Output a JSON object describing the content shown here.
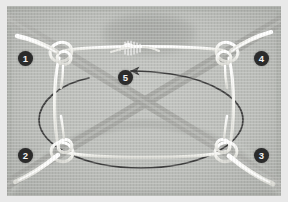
{
  "figure": {
    "width": 288,
    "height": 202,
    "frame_color": "#e9e9e9",
    "plate_color": "#b9bbb8",
    "cord_color": "#f4f4f0",
    "strap_color": "#a9aaa6",
    "arrow_color": "#3a3a3a",
    "marker_fill": "#2b2b2b",
    "marker_text_color": "#f2f2f2"
  },
  "markers": [
    {
      "id": "step-1",
      "label": "1",
      "x": 18,
      "y": 51,
      "note": "upper-left corner knot"
    },
    {
      "id": "step-2",
      "label": "2",
      "x": 18,
      "y": 148,
      "note": "lower-left corner knot"
    },
    {
      "id": "step-3",
      "label": "3",
      "x": 254,
      "y": 148,
      "note": "lower-right corner knot"
    },
    {
      "id": "step-4",
      "label": "4",
      "x": 254,
      "y": 51,
      "note": "upper-right corner knot"
    },
    {
      "id": "step-5",
      "label": "5",
      "x": 118,
      "y": 70,
      "note": "centre top binding / whipping"
    }
  ],
  "arrow": {
    "name": "rotation-arrow",
    "direction": "counter-clockwise",
    "points_toward": "left"
  },
  "knots": [
    {
      "id": "knot-top-left",
      "cx": 60,
      "cy": 55
    },
    {
      "id": "knot-top-right",
      "cx": 222,
      "cy": 55
    },
    {
      "id": "knot-bottom-left",
      "cx": 60,
      "cy": 155
    },
    {
      "id": "knot-bottom-right",
      "cx": 222,
      "cy": 155
    }
  ]
}
